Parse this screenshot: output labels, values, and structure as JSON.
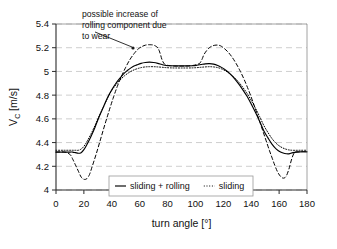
{
  "chart_data": {
    "type": "line",
    "title": "",
    "xlabel": "turn angle [°]",
    "ylabel": "V_C [m/s]",
    "ylabel_main": "V",
    "ylabel_sub": "C",
    "ylabel_unit": " [m/s]",
    "xlim": [
      0,
      180
    ],
    "ylim": [
      4,
      5.4
    ],
    "xticks": [
      0,
      20,
      40,
      60,
      80,
      100,
      120,
      140,
      160,
      180
    ],
    "xtick_labels": [
      "0",
      "20",
      "40",
      "60",
      "80",
      "100",
      "120",
      "140",
      "160",
      "180"
    ],
    "yticks": [
      4,
      4.2,
      4.4,
      4.6,
      4.8,
      5,
      5.2,
      5.4
    ],
    "ytick_labels": [
      "4",
      "4.2",
      "4.4",
      "4.6",
      "4.8",
      "5",
      "5.2",
      "5.4"
    ],
    "grid": "horizontal-dashed",
    "legend_position": "bottom-center",
    "series": [
      {
        "name": "sliding + rolling",
        "style": "solid",
        "color": "#000000",
        "x": [
          0,
          5,
          10,
          12,
          14,
          16,
          18,
          20,
          22,
          25,
          28,
          31,
          34,
          37,
          40,
          43,
          46,
          49,
          52,
          55,
          58,
          61,
          64,
          67,
          70,
          73,
          76,
          79,
          82,
          86,
          90,
          94,
          98,
          101,
          104,
          107,
          110,
          113,
          116,
          119,
          122,
          125,
          128,
          131,
          134,
          137,
          140,
          143,
          146,
          149,
          152,
          155,
          158,
          161,
          164,
          167,
          170,
          175,
          180
        ],
        "y": [
          4.32,
          4.32,
          4.32,
          4.32,
          4.315,
          4.31,
          4.315,
          4.34,
          4.38,
          4.45,
          4.53,
          4.62,
          4.7,
          4.78,
          4.845,
          4.9,
          4.945,
          4.985,
          5.015,
          5.04,
          5.055,
          5.068,
          5.075,
          5.078,
          5.075,
          5.068,
          5.058,
          5.05,
          5.048,
          5.047,
          5.047,
          5.047,
          5.048,
          5.052,
          5.058,
          5.064,
          5.066,
          5.062,
          5.05,
          5.032,
          5.008,
          4.978,
          4.94,
          4.895,
          4.845,
          4.79,
          4.725,
          4.655,
          4.58,
          4.5,
          4.44,
          4.385,
          4.345,
          4.32,
          4.308,
          4.305,
          4.315,
          4.322,
          4.322
        ]
      },
      {
        "name": "sliding",
        "style": "dotted",
        "color": "#000000",
        "x": [
          0,
          5,
          10,
          12,
          14,
          16,
          18,
          20,
          22,
          25,
          28,
          31,
          34,
          37,
          40,
          43,
          46,
          49,
          52,
          55,
          58,
          61,
          64,
          67,
          70,
          73,
          76,
          79,
          82,
          86,
          90,
          94,
          98,
          101,
          104,
          107,
          110,
          113,
          116,
          119,
          122,
          125,
          128,
          131,
          134,
          137,
          140,
          143,
          146,
          149,
          152,
          155,
          158,
          161,
          164,
          167,
          170,
          175,
          180
        ],
        "y": [
          4.335,
          4.335,
          4.335,
          4.335,
          4.335,
          4.335,
          4.345,
          4.368,
          4.405,
          4.47,
          4.545,
          4.625,
          4.7,
          4.775,
          4.84,
          4.888,
          4.928,
          4.962,
          4.988,
          5.008,
          5.022,
          5.032,
          5.038,
          5.04,
          5.04,
          5.038,
          5.035,
          5.032,
          5.03,
          5.029,
          5.029,
          5.029,
          5.03,
          5.032,
          5.035,
          5.038,
          5.04,
          5.038,
          5.032,
          5.02,
          5.002,
          4.978,
          4.948,
          4.91,
          4.865,
          4.815,
          4.755,
          4.69,
          4.62,
          4.545,
          4.485,
          4.432,
          4.392,
          4.365,
          4.348,
          4.338,
          4.335,
          4.335,
          4.335
        ]
      },
      {
        "name": "rolling-with-wear",
        "style": "dashed",
        "color": "#000000",
        "x": [
          0,
          6,
          10,
          12,
          14,
          16,
          18,
          20,
          22,
          24,
          26,
          29,
          32,
          35,
          38,
          41,
          44,
          47,
          50,
          53,
          56,
          59,
          62,
          64,
          66,
          68,
          70,
          72,
          73,
          74,
          75,
          76,
          78,
          82,
          86,
          90,
          94,
          98,
          101,
          103,
          104,
          105,
          106,
          108,
          110,
          112,
          114,
          116,
          118,
          120,
          123,
          126,
          129,
          132,
          135,
          138,
          141,
          144,
          147,
          150,
          153,
          155,
          157,
          159,
          161,
          163,
          165,
          167,
          169,
          171,
          174,
          180
        ],
        "y": [
          4.32,
          4.32,
          4.3,
          4.26,
          4.21,
          4.16,
          4.11,
          4.09,
          4.095,
          4.13,
          4.2,
          4.31,
          4.43,
          4.55,
          4.665,
          4.775,
          4.875,
          4.96,
          5.035,
          5.1,
          5.15,
          5.19,
          5.212,
          5.221,
          5.225,
          5.225,
          5.222,
          5.21,
          5.2,
          5.175,
          5.14,
          5.1,
          5.06,
          5.048,
          5.045,
          5.045,
          5.046,
          5.05,
          5.058,
          5.068,
          5.085,
          5.11,
          5.14,
          5.175,
          5.2,
          5.214,
          5.221,
          5.222,
          5.216,
          5.2,
          5.168,
          5.125,
          5.07,
          5.005,
          4.93,
          4.845,
          4.75,
          4.65,
          4.545,
          4.44,
          4.335,
          4.27,
          4.205,
          4.15,
          4.115,
          4.1,
          4.115,
          4.175,
          4.26,
          4.315,
          4.322,
          4.322
        ]
      }
    ],
    "annotation": {
      "lines": [
        "possible increase of",
        "rolling component due",
        "to wear"
      ],
      "arrow_from": [
        132,
        47
      ],
      "arrow_to": [
        95,
        32
      ],
      "dot_at": [
        133,
        48
      ]
    }
  },
  "legend": {
    "entries": [
      {
        "label": "sliding + rolling",
        "style": "solid"
      },
      {
        "label": "sliding",
        "style": "dotted"
      }
    ]
  }
}
